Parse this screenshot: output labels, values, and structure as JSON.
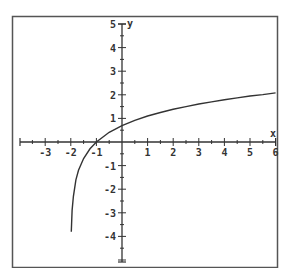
{
  "chart_data": {
    "type": "line",
    "title": "",
    "xlabel": "x",
    "ylabel": "y",
    "xlim": [
      -4,
      6
    ],
    "ylim": [
      -5,
      5
    ],
    "grid": false,
    "legend": null,
    "x_ticks": [
      -3,
      -2,
      -1,
      1,
      2,
      3,
      4,
      5,
      6
    ],
    "y_ticks": [
      -4,
      -3,
      -2,
      -1,
      1,
      2,
      3,
      4,
      5
    ],
    "x_tick_labels": [
      "-3",
      "-2",
      "-1",
      "1",
      "2",
      "3",
      "4",
      "5",
      "6"
    ],
    "y_tick_labels": [
      "-4",
      "-3",
      "-2",
      "-1",
      "1",
      "2",
      "3",
      "4",
      "5"
    ],
    "series": [
      {
        "name": "curve",
        "color": "#333333",
        "x": [
          -1.98,
          -1.95,
          -1.9,
          -1.8,
          -1.7,
          -1.5,
          -1.25,
          -1,
          -0.5,
          0,
          0.5,
          1,
          1.5,
          2,
          2.5,
          3,
          3.5,
          4,
          4.5,
          5,
          5.5,
          6
        ],
        "y": [
          -3.8,
          -2.9,
          -2.3,
          -1.6,
          -1.2,
          -0.7,
          -0.29,
          0,
          0.41,
          0.69,
          0.92,
          1.1,
          1.25,
          1.39,
          1.5,
          1.61,
          1.7,
          1.79,
          1.87,
          1.95,
          2.01,
          2.08
        ]
      }
    ],
    "annotations": []
  },
  "colors": {
    "axis": "#333333",
    "frame": "#555555",
    "curve": "#333333",
    "background": "#ffffff"
  }
}
